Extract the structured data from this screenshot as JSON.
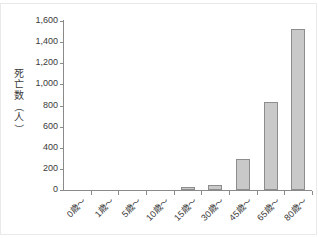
{
  "chart_data": {
    "type": "bar",
    "title": "",
    "subtitle": "",
    "xlabel": "",
    "ylabel": "死亡数（人）",
    "ylabel_chars": [
      "死",
      "亡",
      "数",
      "（",
      "人",
      "）"
    ],
    "categories": [
      "0歳〜",
      "1歳〜",
      "5歳〜",
      "10歳〜",
      "15歳〜",
      "30歳〜",
      "45歳〜",
      "65歳〜",
      "80歳〜"
    ],
    "values": [
      0,
      0,
      0,
      0,
      30,
      50,
      290,
      830,
      1520
    ],
    "ylim": [
      0,
      1600
    ],
    "ytick_values": [
      0,
      200,
      400,
      600,
      800,
      1000,
      1200,
      1400,
      1600
    ],
    "ytick_labels": [
      "0",
      "200",
      "400",
      "600",
      "800",
      "1,000",
      "1,200",
      "1,400",
      "1,600"
    ],
    "grid": false,
    "legend": false,
    "legend_position": "none",
    "bar_fill_color": "#c9c9c9",
    "bar_border_color": "#8d8d8d",
    "axis_color": "#8a8a8a",
    "text_color": "#3a3a3a",
    "background_color": "#ffffff"
  }
}
